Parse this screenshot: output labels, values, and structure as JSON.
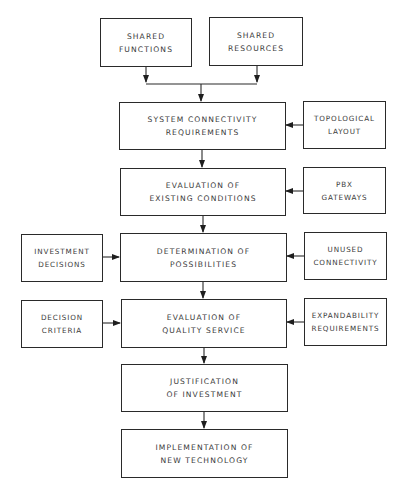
{
  "diagram": {
    "type": "flowchart",
    "colors": {
      "stroke": "#2a2a2a",
      "text": "#3a3a3a",
      "background": "#ffffff"
    },
    "nodes": {
      "shared_functions": {
        "line1": "SHARED",
        "line2": "FUNCTIONS"
      },
      "shared_resources": {
        "line1": "SHARED",
        "line2": "RESOURCES"
      },
      "system_connectivity": {
        "line1": "SYSTEM CONNECTIVITY",
        "line2": "REQUIREMENTS"
      },
      "topological_layout": {
        "line1": "TOPOLOGICAL",
        "line2": "LAYOUT"
      },
      "evaluation_existing": {
        "line1": "EVALUATION OF",
        "line2": "EXISTING CONDITIONS"
      },
      "pbx_gateways": {
        "line1": "PBX",
        "line2": "GATEWAYS"
      },
      "investment_decisions": {
        "line1": "INVESTMENT",
        "line2": "DECISIONS"
      },
      "determination": {
        "line1": "DETERMINATION OF",
        "line2": "POSSIBILITIES"
      },
      "unused_connectivity": {
        "line1": "UNUSED",
        "line2": "CONNECTIVITY"
      },
      "decision_criteria": {
        "line1": "DECISION",
        "line2": "CRITERIA"
      },
      "evaluation_quality": {
        "line1": "EVALUATION OF",
        "line2": "QUALITY SERVICE"
      },
      "expandability": {
        "line1": "EXPANDABILITY",
        "line2": "REQUIREMENTS"
      },
      "justification": {
        "line1": "JUSTIFICATION",
        "line2": "OF INVESTMENT"
      },
      "implementation": {
        "line1": "IMPLEMENTATION OF",
        "line2": "NEW TECHNOLOGY"
      }
    },
    "edges": [
      {
        "from": "shared_functions",
        "to": "system_connectivity"
      },
      {
        "from": "shared_resources",
        "to": "system_connectivity"
      },
      {
        "from": "topological_layout",
        "to": "system_connectivity"
      },
      {
        "from": "system_connectivity",
        "to": "evaluation_existing"
      },
      {
        "from": "pbx_gateways",
        "to": "evaluation_existing"
      },
      {
        "from": "evaluation_existing",
        "to": "determination"
      },
      {
        "from": "investment_decisions",
        "to": "determination"
      },
      {
        "from": "unused_connectivity",
        "to": "determination"
      },
      {
        "from": "determination",
        "to": "evaluation_quality"
      },
      {
        "from": "decision_criteria",
        "to": "evaluation_quality"
      },
      {
        "from": "expandability",
        "to": "evaluation_quality"
      },
      {
        "from": "evaluation_quality",
        "to": "justification"
      },
      {
        "from": "justification",
        "to": "implementation"
      }
    ]
  }
}
